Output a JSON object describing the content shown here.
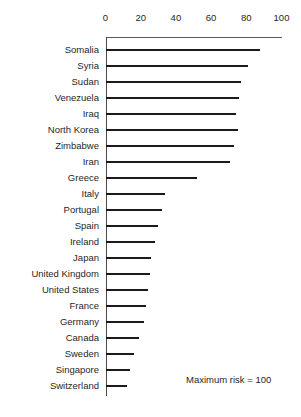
{
  "chart_data": {
    "type": "bar",
    "orientation": "horizontal",
    "title": "",
    "subtitle": "",
    "xlabel": "",
    "ylabel": "",
    "xlim": [
      0,
      100
    ],
    "ylim": null,
    "grid": false,
    "legend": null,
    "ticks": [
      "0",
      "20",
      "40",
      "60",
      "80",
      "100"
    ],
    "tick_values": [
      0,
      20,
      40,
      60,
      80,
      100
    ],
    "categories": [
      "Somalia",
      "Syria",
      "Sudan",
      "Venezuela",
      "Iraq",
      "North Korea",
      "Zimbabwe",
      "Iran",
      "Greece",
      "Italy",
      "Portugal",
      "Spain",
      "Ireland",
      "Japan",
      "United Kingdom",
      "United States",
      "France",
      "Germany",
      "Canada",
      "Sweden",
      "Singapore",
      "Switzerland"
    ],
    "values": [
      88,
      81,
      77,
      76,
      74,
      75,
      73,
      71,
      52,
      34,
      32,
      30,
      28,
      26,
      25,
      24,
      23,
      22,
      19,
      16,
      14,
      12
    ],
    "annotations": [
      {
        "text": "Maximum risk = 100"
      }
    ],
    "bar_color": "#1a1a1a",
    "axis_color": "#4a4a4a",
    "background": "#ffffff"
  },
  "footnote": {
    "text": "Maximum risk = 100"
  }
}
